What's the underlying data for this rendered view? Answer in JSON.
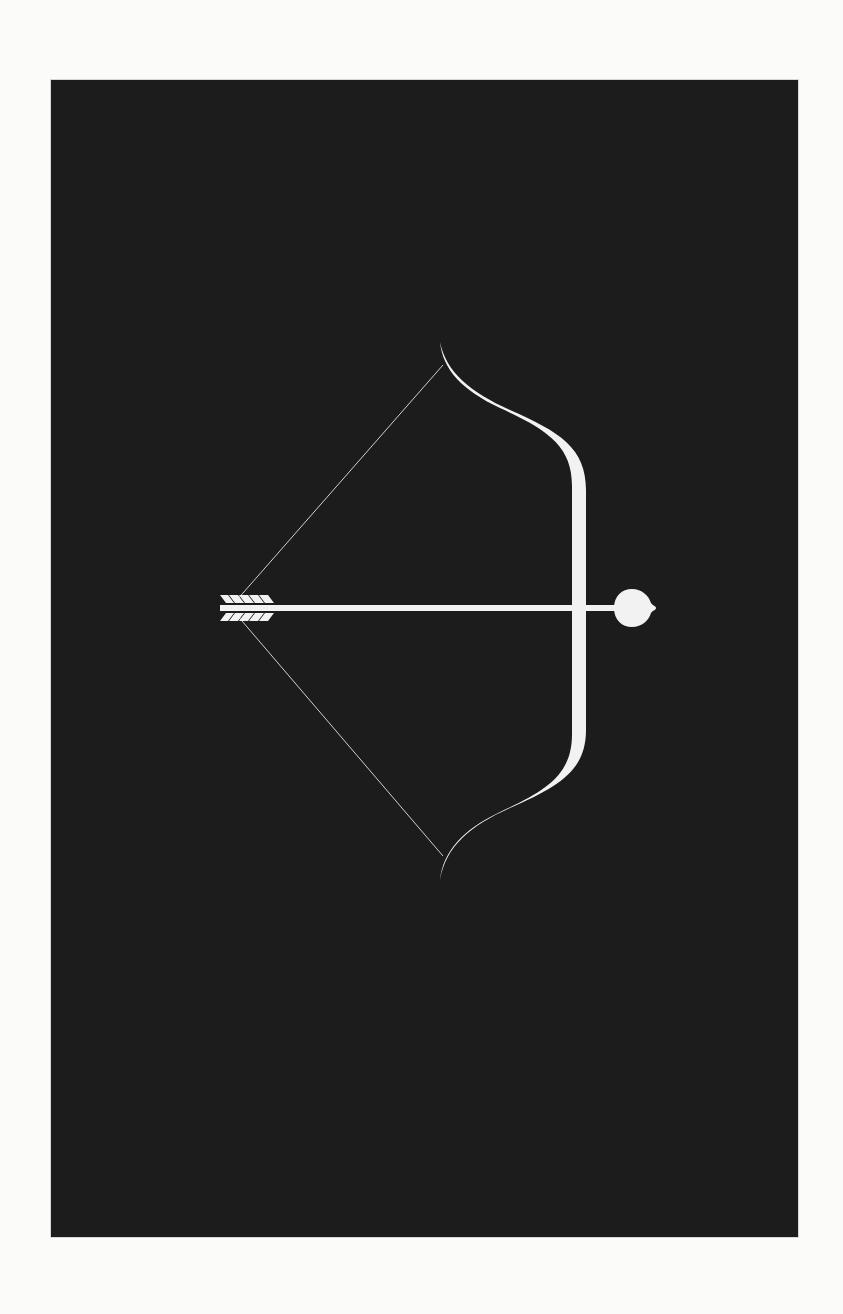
{
  "artwork": {
    "subject": "bow and arrow with heart-tipped arrow",
    "background_color": "#1c1c1c",
    "foreground_color": "#f2f2f2",
    "page_color": "#fbfbfa"
  },
  "elements": {
    "bow": "bow-icon",
    "bowstring": "bowstring",
    "arrow": "arrow-icon",
    "arrowhead": "heart-icon",
    "fletching": "fletching-icon"
  }
}
